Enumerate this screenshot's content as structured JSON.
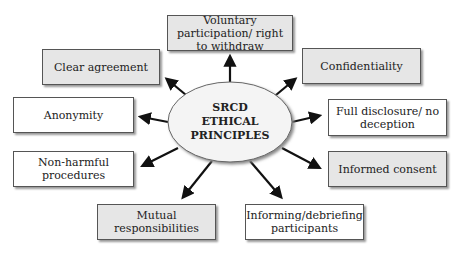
{
  "diagram": {
    "center": {
      "line1": "SRCD",
      "line2": "ETHICAL",
      "line3": "PRINCIPLES"
    },
    "nodes": [
      {
        "id": "voluntary",
        "text": "Voluntary participation/ right to withdraw",
        "shaded": true
      },
      {
        "id": "clear",
        "text": "Clear agreement",
        "shaded": true
      },
      {
        "id": "confidentiality",
        "text": "Confidentiality",
        "shaded": true
      },
      {
        "id": "anonymity",
        "text": "Anonymity",
        "shaded": false
      },
      {
        "id": "full",
        "text": "Full disclosure/ no deception",
        "shaded": false
      },
      {
        "id": "nonharmful",
        "text": "Non-harmful procedures",
        "shaded": false
      },
      {
        "id": "informed",
        "text": "Informed consent",
        "shaded": true
      },
      {
        "id": "mutual",
        "text": "Mutual responsibilities",
        "shaded": true
      },
      {
        "id": "informing",
        "text": "Informing/debriefing participants",
        "shaded": false
      }
    ],
    "colors": {
      "shaded_fill": "#e6e6e6",
      "border": "#555555",
      "arrow": "#111111",
      "ellipse_fill": "#f4f4f4"
    }
  }
}
